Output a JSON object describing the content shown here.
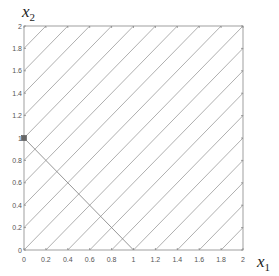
{
  "chart_data": {
    "type": "line",
    "title": "",
    "xlabel": "x1",
    "ylabel": "x2",
    "xlim": [
      0,
      2
    ],
    "ylim": [
      0,
      2
    ],
    "grid": false,
    "x_ticks": [
      "0",
      "0.2",
      "0.4",
      "0.6",
      "0.8",
      "1",
      "1.2",
      "1.4",
      "1.6",
      "1.8",
      "2"
    ],
    "y_ticks": [
      "0",
      "0.2",
      "0.4",
      "0.6",
      "0.8",
      "1",
      "1.2",
      "1.4",
      "1.6",
      "1.8",
      "2"
    ],
    "contour_lines": {
      "description": "level lines x2 - x1 = c",
      "levels": [
        -1.8,
        -1.6,
        -1.4,
        -1.2,
        -1.0,
        -0.8,
        -0.6,
        -0.4,
        -0.2,
        0.0,
        0.2,
        0.4,
        0.6,
        0.8,
        1.0,
        1.2,
        1.4,
        1.6,
        1.8
      ]
    },
    "series": [
      {
        "name": "constraint x1 + x2 = 1",
        "x": [
          0,
          1
        ],
        "y": [
          1,
          0
        ]
      }
    ],
    "markers": [
      {
        "name": "point",
        "x": 0,
        "y": 1
      }
    ]
  },
  "labels": {
    "x_main": "x",
    "x_sub": "1",
    "y_main": "x",
    "y_sub": "2"
  },
  "colors": {
    "axes": "#888888",
    "lines": "#9a9a9a",
    "text": "#555555"
  }
}
